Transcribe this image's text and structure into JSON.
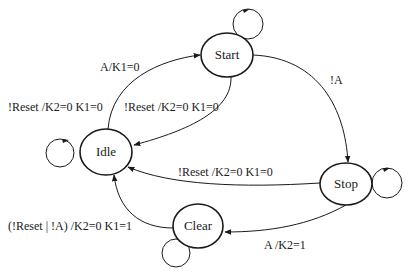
{
  "diagram": {
    "type": "state-machine",
    "nodes": [
      {
        "id": "start",
        "label": "Start"
      },
      {
        "id": "idle",
        "label": "Idle"
      },
      {
        "id": "stop",
        "label": "Stop"
      },
      {
        "id": "clear",
        "label": "Clear"
      }
    ],
    "edges": [
      {
        "from": "idle",
        "to": "start",
        "label": "A/K1=0"
      },
      {
        "from": "start",
        "to": "idle",
        "label": "!Reset /K2=0 K1=0"
      },
      {
        "from": "start",
        "to": "stop",
        "label": "!A"
      },
      {
        "from": "stop",
        "to": "idle",
        "label": "!Reset /K2=0 K1=0"
      },
      {
        "from": "stop",
        "to": "clear",
        "label": "A /K2=1"
      },
      {
        "from": "clear",
        "to": "idle",
        "label": "(!Reset | !A) /K2=0 K1=1"
      },
      {
        "from": "start",
        "to": "start",
        "label": ""
      },
      {
        "from": "idle",
        "to": "idle",
        "label": ""
      },
      {
        "from": "stop",
        "to": "stop",
        "label": ""
      },
      {
        "from": "clear",
        "to": "clear",
        "label": ""
      }
    ],
    "extra_labels": {
      "idle_left": "!Reset /K2=0 K1=0"
    }
  }
}
